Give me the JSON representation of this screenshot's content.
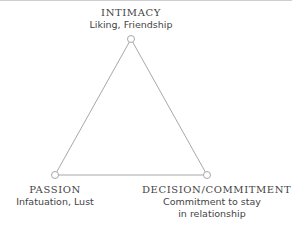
{
  "diagram": {
    "type": "triangle",
    "line_color": "#a8a8a8",
    "vertices": [
      {
        "id": "intimacy",
        "title": "INTIMACY",
        "subtitle": [
          "Liking, Friendship"
        ],
        "x": 131,
        "y": 39
      },
      {
        "id": "passion",
        "title": "PASSION",
        "subtitle": [
          "Infatuation, Lust"
        ],
        "x": 55,
        "y": 175
      },
      {
        "id": "commitment",
        "title": "DECISION/COMMITMENT",
        "subtitle": [
          "Commitment to stay",
          "in relationship"
        ],
        "x": 207,
        "y": 175
      }
    ]
  }
}
